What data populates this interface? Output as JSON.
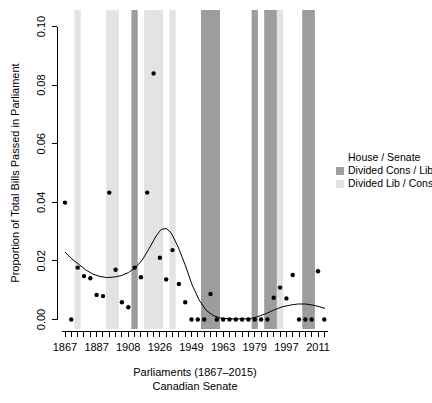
{
  "figure": {
    "width": 432,
    "height": 403,
    "background": "#ffffff"
  },
  "chart_data": {
    "type": "scatter",
    "title": "",
    "xlabel": "Parliaments (1867–2015)",
    "sublabel": "Canadian Senate",
    "ylabel": "Proportion of Total Bills Passed in Parliament",
    "ylim": [
      0.0,
      0.1
    ],
    "y_ticks": [
      0.0,
      0.02,
      0.04,
      0.06,
      0.08,
      0.1
    ],
    "y_tick_labels": [
      "0.00",
      "0.02",
      "0.04",
      "0.06",
      "0.08",
      "0.10"
    ],
    "x_range_parliaments": [
      1,
      42
    ],
    "x_tick_parliaments": [
      1,
      6,
      11,
      16,
      21,
      26,
      31,
      36,
      41
    ],
    "x_tick_labels": [
      "1867",
      "1887",
      "1908",
      "1926",
      "1949",
      "1963",
      "1979",
      "1997",
      "2011"
    ],
    "grid": false,
    "points": [
      {
        "parliament": 1,
        "year": 1867,
        "value": 0.0399
      },
      {
        "parliament": 2,
        "year": 1872,
        "value": 0.0
      },
      {
        "parliament": 3,
        "year": 1874,
        "value": 0.0177
      },
      {
        "parliament": 4,
        "year": 1878,
        "value": 0.0148
      },
      {
        "parliament": 5,
        "year": 1882,
        "value": 0.0141
      },
      {
        "parliament": 6,
        "year": 1887,
        "value": 0.0084
      },
      {
        "parliament": 7,
        "year": 1891,
        "value": 0.008
      },
      {
        "parliament": 8,
        "year": 1896,
        "value": 0.0433
      },
      {
        "parliament": 9,
        "year": 1900,
        "value": 0.017
      },
      {
        "parliament": 10,
        "year": 1904,
        "value": 0.0059
      },
      {
        "parliament": 11,
        "year": 1908,
        "value": 0.0042
      },
      {
        "parliament": 12,
        "year": 1911,
        "value": 0.0177
      },
      {
        "parliament": 13,
        "year": 1917,
        "value": 0.0144
      },
      {
        "parliament": 14,
        "year": 1921,
        "value": 0.0433
      },
      {
        "parliament": 15,
        "year": 1925,
        "value": 0.084
      },
      {
        "parliament": 16,
        "year": 1926,
        "value": 0.0211
      },
      {
        "parliament": 17,
        "year": 1930,
        "value": 0.0137
      },
      {
        "parliament": 18,
        "year": 1935,
        "value": 0.0237
      },
      {
        "parliament": 19,
        "year": 1940,
        "value": 0.0121
      },
      {
        "parliament": 20,
        "year": 1945,
        "value": 0.0059
      },
      {
        "parliament": 21,
        "year": 1949,
        "value": 0.0
      },
      {
        "parliament": 22,
        "year": 1953,
        "value": 0.0
      },
      {
        "parliament": 23,
        "year": 1957,
        "value": 0.0
      },
      {
        "parliament": 24,
        "year": 1958,
        "value": 0.0087
      },
      {
        "parliament": 25,
        "year": 1962,
        "value": 0.0
      },
      {
        "parliament": 26,
        "year": 1963,
        "value": 0.0
      },
      {
        "parliament": 27,
        "year": 1965,
        "value": 0.0
      },
      {
        "parliament": 28,
        "year": 1968,
        "value": 0.0
      },
      {
        "parliament": 29,
        "year": 1972,
        "value": 0.0
      },
      {
        "parliament": 30,
        "year": 1974,
        "value": 0.0
      },
      {
        "parliament": 31,
        "year": 1979,
        "value": 0.0
      },
      {
        "parliament": 32,
        "year": 1980,
        "value": 0.0
      },
      {
        "parliament": 33,
        "year": 1984,
        "value": 0.0
      },
      {
        "parliament": 34,
        "year": 1988,
        "value": 0.0074
      },
      {
        "parliament": 35,
        "year": 1993,
        "value": 0.0109
      },
      {
        "parliament": 36,
        "year": 1997,
        "value": 0.0072
      },
      {
        "parliament": 37,
        "year": 2000,
        "value": 0.0152
      },
      {
        "parliament": 38,
        "year": 2004,
        "value": 0.0
      },
      {
        "parliament": 39,
        "year": 2006,
        "value": 0.0
      },
      {
        "parliament": 40,
        "year": 2008,
        "value": 0.0
      },
      {
        "parliament": 41,
        "year": 2011,
        "value": 0.0165
      },
      {
        "parliament": 42,
        "year": 2015,
        "value": 0.0
      }
    ],
    "bands": [
      {
        "from_parliament": 3,
        "to_parliament": 3,
        "years": "1874",
        "type": "divided_lib_cons"
      },
      {
        "from_parliament": 8,
        "to_parliament": 9,
        "years": "1896-1900",
        "type": "divided_lib_cons"
      },
      {
        "from_parliament": 12,
        "to_parliament": 12,
        "years": "1911",
        "type": "divided_cons_lib"
      },
      {
        "from_parliament": 14,
        "to_parliament": 16,
        "years": "1921-1926",
        "type": "divided_lib_cons"
      },
      {
        "from_parliament": 18,
        "to_parliament": 18,
        "years": "1935",
        "type": "divided_lib_cons"
      },
      {
        "from_parliament": 23,
        "to_parliament": 25,
        "years": "1957-1962",
        "type": "divided_cons_lib"
      },
      {
        "from_parliament": 31,
        "to_parliament": 31,
        "years": "1979",
        "type": "divided_cons_lib"
      },
      {
        "from_parliament": 33,
        "to_parliament": 34,
        "years": "1984-1988",
        "type": "divided_cons_lib"
      },
      {
        "from_parliament": 35,
        "to_parliament": 35,
        "years": "1993",
        "type": "divided_lib_cons"
      },
      {
        "from_parliament": 39,
        "to_parliament": 40,
        "years": "2006-2008",
        "type": "divided_cons_lib"
      }
    ],
    "trend_line": [
      [
        1.0,
        0.023
      ],
      [
        2.1,
        0.0206
      ],
      [
        3.2,
        0.0188
      ],
      [
        4.3,
        0.0169
      ],
      [
        5.4,
        0.0155
      ],
      [
        6.5,
        0.0147
      ],
      [
        7.6,
        0.0143
      ],
      [
        8.8,
        0.0145
      ],
      [
        9.9,
        0.015
      ],
      [
        11.0,
        0.016
      ],
      [
        12.1,
        0.0176
      ],
      [
        13.2,
        0.0203
      ],
      [
        14.3,
        0.0242
      ],
      [
        15.4,
        0.0285
      ],
      [
        16.2,
        0.0307
      ],
      [
        17.0,
        0.0311
      ],
      [
        17.8,
        0.0295
      ],
      [
        18.9,
        0.0247
      ],
      [
        20.0,
        0.0186
      ],
      [
        21.1,
        0.0118
      ],
      [
        22.2,
        0.0067
      ],
      [
        23.3,
        0.0032
      ],
      [
        24.4,
        0.0014
      ],
      [
        25.5,
        0.0005
      ],
      [
        27.1,
        0.0002
      ],
      [
        28.7,
        0.0002
      ],
      [
        30.3,
        0.0003
      ],
      [
        31.5,
        0.001
      ],
      [
        32.8,
        0.002
      ],
      [
        34.0,
        0.0032
      ],
      [
        35.3,
        0.0043
      ],
      [
        36.6,
        0.0049
      ],
      [
        37.8,
        0.0053
      ],
      [
        39.1,
        0.0053
      ],
      [
        40.4,
        0.0048
      ],
      [
        41.3,
        0.0043
      ],
      [
        42.1,
        0.0038
      ]
    ],
    "legend": {
      "title": "House / Senate",
      "entries": [
        {
          "key": "divided_cons_lib",
          "label": "Divided Cons / Lib",
          "color": "#9d9d9d"
        },
        {
          "key": "divided_lib_cons",
          "label": "Divided Lib / Cons",
          "color": "#e3e3e3"
        }
      ]
    },
    "colors": {
      "divided_cons_lib": "#9d9d9d",
      "divided_lib_cons": "#e3e3e3",
      "point": "#000000",
      "trend_line": "#000000",
      "axis": "#000000",
      "background": "#ffffff"
    }
  }
}
